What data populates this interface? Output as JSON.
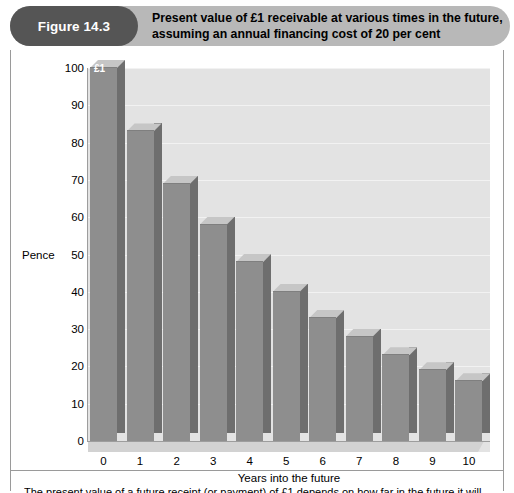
{
  "figure": {
    "badge_label": "Figure 14.3",
    "title_line1": "Present value of £1 receivable at various times in the future,",
    "title_line2": "assuming an annual financing cost of 20 per cent",
    "caption": "The present value of a future receipt (or payment) of £1 depends on how far in the future it will"
  },
  "colors": {
    "badge_bg": "#555555",
    "title_bar_bg": "#b8b8b8",
    "plot_bg": "#e3e3e3",
    "bar_front": "#8e8e8e",
    "bar_side": "#6e6e6e",
    "bar_top": "#c6c6c6",
    "gridline": "#f2f2f2",
    "axis": "#9d9d9d"
  },
  "chart_data": {
    "type": "bar",
    "title": "Present value of £1 receivable at various times in the future, assuming an annual financing cost of 20 per cent",
    "xlabel": "Years into the future",
    "ylabel": "Pence",
    "ylim": [
      0,
      100
    ],
    "ytick_step": 10,
    "yticks": [
      0,
      10,
      20,
      30,
      40,
      50,
      60,
      70,
      80,
      90,
      100
    ],
    "ytick_labels": [
      "0",
      "10",
      "20",
      "30",
      "40",
      "50",
      "60",
      "70",
      "80",
      "90",
      "100"
    ],
    "grid": true,
    "legend": false,
    "categories": [
      "0",
      "1",
      "2",
      "3",
      "4",
      "5",
      "6",
      "7",
      "8",
      "9",
      "10"
    ],
    "values": [
      100,
      83,
      69,
      58,
      48,
      40,
      33,
      28,
      23,
      19,
      16
    ],
    "annotations": [
      {
        "category": "0",
        "text": "£1"
      }
    ]
  }
}
